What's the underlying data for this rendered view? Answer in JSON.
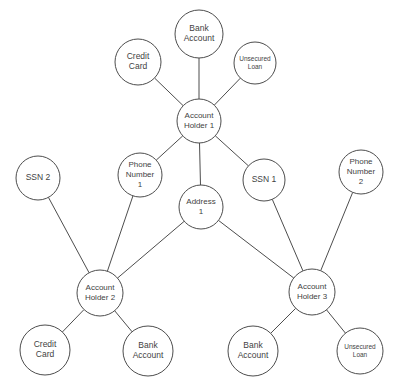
{
  "diagram": {
    "type": "node-link-graph",
    "background_color": "#ffffff",
    "node_fill_color": "#ffffff",
    "node_stroke_color": "#4d4d4d",
    "edge_color": "#4d4d4d",
    "label_color": "#3f3f3f"
  },
  "nodes": [
    {
      "id": "bank-account-1",
      "label": "Bank Account",
      "lines": [
        "Bank",
        "Account"
      ],
      "x": 199,
      "y": 34,
      "r": 24,
      "font_size": 8.5
    },
    {
      "id": "credit-card-1",
      "label": "Credit Card",
      "lines": [
        "Credit",
        "Card"
      ],
      "x": 138,
      "y": 62,
      "r": 23,
      "font_size": 8.5
    },
    {
      "id": "unsecured-loan-1",
      "label": "Unsecured Loan",
      "lines": [
        "Unsecured",
        "Loan"
      ],
      "x": 255,
      "y": 63,
      "r": 21,
      "font_size": 6.5
    },
    {
      "id": "account-holder-1",
      "label": "Account Holder 1",
      "lines": [
        "Account",
        "Holder 1"
      ],
      "x": 199,
      "y": 121,
      "r": 22,
      "font_size": 8
    },
    {
      "id": "ssn-2",
      "label": "SSN 2",
      "lines": [
        "SSN 2"
      ],
      "x": 38,
      "y": 178,
      "r": 22,
      "font_size": 8.5
    },
    {
      "id": "phone-number-1",
      "label": "Phone Number 1",
      "lines": [
        "Phone",
        "Number",
        "1"
      ],
      "x": 140,
      "y": 175,
      "r": 22,
      "font_size": 8
    },
    {
      "id": "ssn-1",
      "label": "SSN 1",
      "lines": [
        "SSN 1"
      ],
      "x": 264,
      "y": 180,
      "r": 21,
      "font_size": 8.5
    },
    {
      "id": "phone-number-2",
      "label": "Phone Number 2",
      "lines": [
        "Phone",
        "Number",
        "2"
      ],
      "x": 361,
      "y": 172,
      "r": 22,
      "font_size": 8
    },
    {
      "id": "address-1",
      "label": "Address 1",
      "lines": [
        "Address",
        "1"
      ],
      "x": 201,
      "y": 207,
      "r": 22,
      "font_size": 8
    },
    {
      "id": "account-holder-2",
      "label": "Account Holder 2",
      "lines": [
        "Account",
        "Holder 2"
      ],
      "x": 100,
      "y": 293,
      "r": 23,
      "font_size": 8
    },
    {
      "id": "account-holder-3",
      "label": "Account Holder 3",
      "lines": [
        "Account",
        "Holder 3"
      ],
      "x": 312,
      "y": 292,
      "r": 23,
      "font_size": 8
    },
    {
      "id": "credit-card-2",
      "label": "Credit Card",
      "lines": [
        "Credit",
        "Card"
      ],
      "x": 45,
      "y": 350,
      "r": 25,
      "font_size": 8.5
    },
    {
      "id": "bank-account-2",
      "label": "Bank Account",
      "lines": [
        "Bank",
        "Account"
      ],
      "x": 148,
      "y": 351,
      "r": 25,
      "font_size": 8.5
    },
    {
      "id": "bank-account-3",
      "label": "Bank Account",
      "lines": [
        "Bank",
        "Account"
      ],
      "x": 253,
      "y": 351,
      "r": 25,
      "font_size": 8.5
    },
    {
      "id": "unsecured-loan-2",
      "label": "Unsecured Loan",
      "lines": [
        "Unsecured",
        "Loan"
      ],
      "x": 360,
      "y": 351,
      "r": 23,
      "font_size": 6.5
    }
  ],
  "edges": [
    {
      "id": "edge-ah1-bank1",
      "source": "account-holder-1",
      "target": "bank-account-1"
    },
    {
      "id": "edge-ah1-credit1",
      "source": "account-holder-1",
      "target": "credit-card-1"
    },
    {
      "id": "edge-ah1-loan1",
      "source": "account-holder-1",
      "target": "unsecured-loan-1"
    },
    {
      "id": "edge-ah1-phone1",
      "source": "account-holder-1",
      "target": "phone-number-1"
    },
    {
      "id": "edge-ah1-ssn1",
      "source": "account-holder-1",
      "target": "ssn-1"
    },
    {
      "id": "edge-ah1-address1",
      "source": "account-holder-1",
      "target": "address-1"
    },
    {
      "id": "edge-ssn2-ah2",
      "source": "ssn-2",
      "target": "account-holder-2"
    },
    {
      "id": "edge-phone1-ah2",
      "source": "phone-number-1",
      "target": "account-holder-2"
    },
    {
      "id": "edge-address1-ah2",
      "source": "address-1",
      "target": "account-holder-2"
    },
    {
      "id": "edge-address1-ah3",
      "source": "address-1",
      "target": "account-holder-3"
    },
    {
      "id": "edge-ssn1-ah3",
      "source": "ssn-1",
      "target": "account-holder-3"
    },
    {
      "id": "edge-phone2-ah3",
      "source": "phone-number-2",
      "target": "account-holder-3"
    },
    {
      "id": "edge-ah2-credit2",
      "source": "account-holder-2",
      "target": "credit-card-2"
    },
    {
      "id": "edge-ah2-bank2",
      "source": "account-holder-2",
      "target": "bank-account-2"
    },
    {
      "id": "edge-ah3-bank3",
      "source": "account-holder-3",
      "target": "bank-account-3"
    },
    {
      "id": "edge-ah3-loan2",
      "source": "account-holder-3",
      "target": "unsecured-loan-2"
    }
  ]
}
